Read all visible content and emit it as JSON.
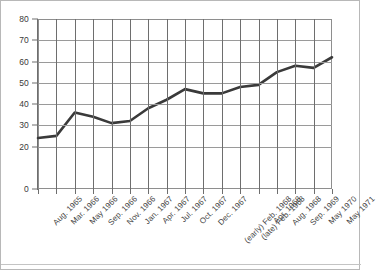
{
  "chart_data": {
    "type": "line",
    "title": "",
    "subtitle": "",
    "xlabel": "",
    "ylabel": "",
    "ylim": [
      0,
      80
    ],
    "yticks": [
      0,
      20,
      30,
      40,
      50,
      60,
      70,
      80
    ],
    "ytick_labels": [
      "0",
      "20",
      "30",
      "40",
      "50",
      "60",
      "70",
      "80"
    ],
    "grid": true,
    "grid_axis": "both",
    "legend": false,
    "legend_position": "none",
    "line_color": "#3a3a3a",
    "grid_color": "#9a9a9a",
    "background_color": "#ffffff",
    "categories": [
      "Aug. 1965",
      "Mar. 1966",
      "May 1966",
      "Sep. 1966",
      "Nov. 1966",
      "Jan. 1967",
      "Apr. 1967",
      "Jul. 1967",
      "Oct. 1967",
      "Dec. 1967",
      "(early) Feb. 1968",
      "(late) Feb. 1968",
      "Apr. 1968",
      "Aug. 1968",
      "Sep. 1969",
      "May 1970",
      "May 1971"
    ],
    "values": [
      24,
      25,
      36,
      34,
      31,
      32,
      38,
      42,
      47,
      45,
      45,
      48,
      49,
      55,
      58,
      57,
      62
    ],
    "series": [
      {
        "name": "series-1",
        "values": [
          24,
          25,
          36,
          34,
          31,
          32,
          38,
          42,
          47,
          45,
          45,
          48,
          49,
          55,
          58,
          57,
          62
        ]
      }
    ]
  }
}
